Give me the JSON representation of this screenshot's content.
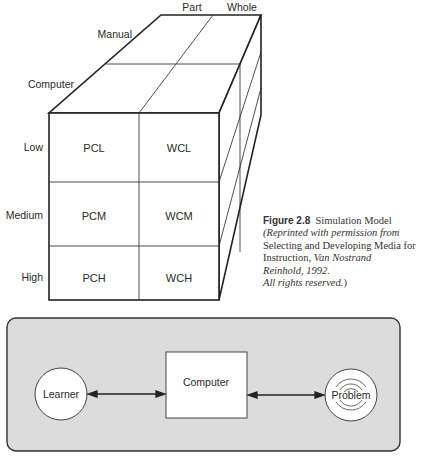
{
  "cube": {
    "top_labels": {
      "part": "Part",
      "whole": "Whole"
    },
    "depth_labels": {
      "manual": "Manual",
      "computer": "Computer"
    },
    "row_labels": [
      "Low",
      "Medium",
      "High"
    ],
    "cells": [
      [
        "PCL",
        "WCL"
      ],
      [
        "PCM",
        "WCM"
      ],
      [
        "PCH",
        "WCH"
      ]
    ]
  },
  "caption": {
    "figure_number": "Figure 2.8",
    "title": "Simulation Model",
    "line1": "(Reprinted with permission from",
    "line2": "Selecting and Developing Media for",
    "line3_plain": "Instruction, ",
    "line3_italic": "Van Nostrand",
    "line4": "Reinhold, 1992.",
    "line5": "All rights reserved.",
    "line5_close": ")"
  },
  "flow": {
    "learner": "Learner",
    "computer": "Computer",
    "problem": "Problem",
    "panel_color": "#dcdcdc"
  }
}
